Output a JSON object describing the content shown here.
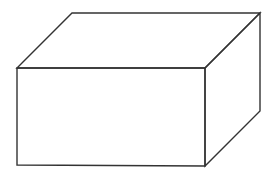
{
  "diagram": {
    "type": "cuboid-wireframe",
    "canvas": {
      "width": 280,
      "height": 177,
      "background": "#ffffff"
    },
    "stroke_color": "#333333",
    "vertices": {
      "front_top_left": [
        17,
        68
      ],
      "front_top_right": [
        205,
        68
      ],
      "front_bottom_right": [
        205,
        166
      ],
      "front_bottom_left": [
        17,
        165
      ],
      "back_top_left": [
        72,
        13
      ],
      "back_top_right": [
        260,
        13
      ],
      "back_bottom_right": [
        260,
        111
      ]
    },
    "faces": [
      {
        "name": "front",
        "points": "17,68 205,68 205,166 17,165"
      },
      {
        "name": "top",
        "points": "17,68 72,13 260,13 205,68"
      },
      {
        "name": "right",
        "points": "205,68 260,13 260,111 205,166"
      }
    ]
  }
}
